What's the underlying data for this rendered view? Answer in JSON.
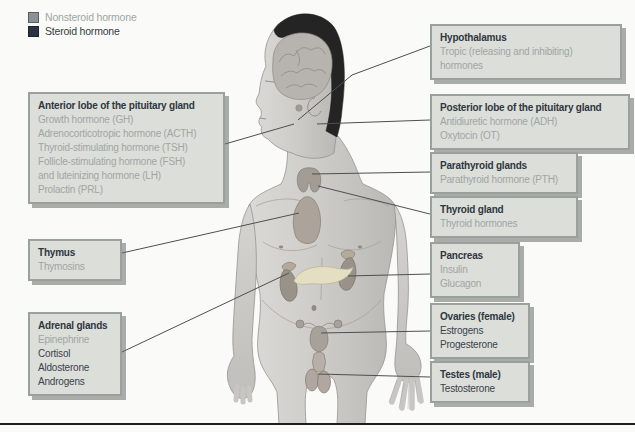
{
  "figure": {
    "colors": {
      "background": "#fafaf8",
      "box_bg": "#dcdeda",
      "box_border": "#9aa09c",
      "title_text": "#2f3740",
      "nonsteroid_text": "#9fa6a4",
      "steroid_text": "#3a434c",
      "leader_line": "#4f4f4f",
      "bottom_rule": "#1d1d1d",
      "nonsteroid_swatch": "#8b9297",
      "steroid_swatch": "#2a333f"
    }
  },
  "legend": {
    "items": [
      {
        "label": "Nonsteroid hormone",
        "type": "nonsteroid"
      },
      {
        "label": "Steroid hormone",
        "type": "steroid"
      }
    ]
  },
  "boxes": [
    {
      "id": "anterior-pituitary",
      "title": "Anterior lobe of the pituitary gland",
      "hormones": [
        {
          "text": "Growth hormone (GH)",
          "type": "nonsteroid"
        },
        {
          "text": "Adrenocorticotropic hormone (ACTH)",
          "type": "nonsteroid"
        },
        {
          "text": "Thyroid-stimulating hormone (TSH)",
          "type": "nonsteroid"
        },
        {
          "text": "Follicle-stimulating hormone (FSH)",
          "type": "nonsteroid"
        },
        {
          "text": "and luteinizing hormone (LH)",
          "type": "nonsteroid"
        },
        {
          "text": "Prolactin (PRL)",
          "type": "nonsteroid"
        }
      ]
    },
    {
      "id": "thymus",
      "title": "Thymus",
      "hormones": [
        {
          "text": "Thymosins",
          "type": "nonsteroid"
        }
      ]
    },
    {
      "id": "adrenal-glands",
      "title": "Adrenal glands",
      "hormones": [
        {
          "text": "Epinephrine",
          "type": "nonsteroid"
        },
        {
          "text": "Cortisol",
          "type": "steroid"
        },
        {
          "text": "Aldosterone",
          "type": "steroid"
        },
        {
          "text": "Androgens",
          "type": "steroid"
        }
      ]
    },
    {
      "id": "hypothalamus",
      "title": "Hypothalamus",
      "hormones": [
        {
          "text": "Tropic (releasing and inhibiting) hormones",
          "type": "nonsteroid"
        }
      ]
    },
    {
      "id": "posterior-pituitary",
      "title": "Posterior lobe of the pituitary gland",
      "hormones": [
        {
          "text": "Antidiuretic hormone (ADH)",
          "type": "nonsteroid"
        },
        {
          "text": "Oxytocin (OT)",
          "type": "nonsteroid"
        }
      ]
    },
    {
      "id": "parathyroid-glands",
      "title": "Parathyroid glands",
      "hormones": [
        {
          "text": "Parathyroid hormone (PTH)",
          "type": "nonsteroid"
        }
      ]
    },
    {
      "id": "thyroid-gland",
      "title": "Thyroid gland",
      "hormones": [
        {
          "text": "Thyroid hormones",
          "type": "nonsteroid"
        }
      ]
    },
    {
      "id": "pancreas",
      "title": "Pancreas",
      "hormones": [
        {
          "text": "Insulin",
          "type": "nonsteroid"
        },
        {
          "text": "Glucagon",
          "type": "nonsteroid"
        }
      ]
    },
    {
      "id": "ovaries",
      "title": "Ovaries (female)",
      "hormones": [
        {
          "text": "Estrogens",
          "type": "steroid"
        },
        {
          "text": "Progesterone",
          "type": "steroid"
        }
      ]
    },
    {
      "id": "testes",
      "title": "Testes (male)",
      "hormones": [
        {
          "text": "Testosterone",
          "type": "steroid"
        }
      ]
    }
  ]
}
